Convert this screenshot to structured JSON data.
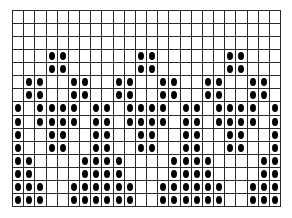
{
  "pattern": {
    "columns": 24,
    "rows": 15,
    "dot_color": "#000000",
    "line_color": "#2a2a2a",
    "background": "#ffffff",
    "filled": [
      [],
      [],
      [],
      [
        3,
        4,
        11,
        12,
        19,
        20
      ],
      [
        3,
        4,
        11,
        12,
        19,
        20
      ],
      [
        1,
        2,
        5,
        6,
        9,
        10,
        13,
        14,
        17,
        18,
        21,
        22
      ],
      [
        1,
        2,
        5,
        6,
        9,
        10,
        13,
        14,
        17,
        18,
        21,
        22
      ],
      [
        0,
        2,
        3,
        4,
        5,
        7,
        8,
        10,
        11,
        12,
        13,
        15,
        16,
        18,
        19,
        20,
        21,
        23
      ],
      [
        0,
        2,
        3,
        4,
        5,
        7,
        8,
        10,
        11,
        12,
        13,
        15,
        16,
        18,
        19,
        20,
        21,
        23
      ],
      [
        0,
        3,
        4,
        7,
        8,
        11,
        12,
        15,
        16,
        19,
        20,
        23
      ],
      [
        0,
        3,
        4,
        7,
        8,
        11,
        12,
        15,
        16,
        19,
        20,
        23
      ],
      [
        0,
        1,
        6,
        7,
        8,
        9,
        14,
        15,
        16,
        17,
        22,
        23
      ],
      [
        0,
        1,
        6,
        7,
        8,
        9,
        14,
        15,
        16,
        17,
        22,
        23
      ],
      [
        0,
        1,
        2,
        5,
        6,
        7,
        8,
        9,
        10,
        13,
        14,
        15,
        16,
        17,
        18,
        21,
        22,
        23
      ],
      [
        0,
        1,
        2,
        5,
        6,
        7,
        8,
        9,
        10,
        13,
        14,
        15,
        16,
        17,
        18,
        21,
        22,
        23
      ]
    ]
  }
}
